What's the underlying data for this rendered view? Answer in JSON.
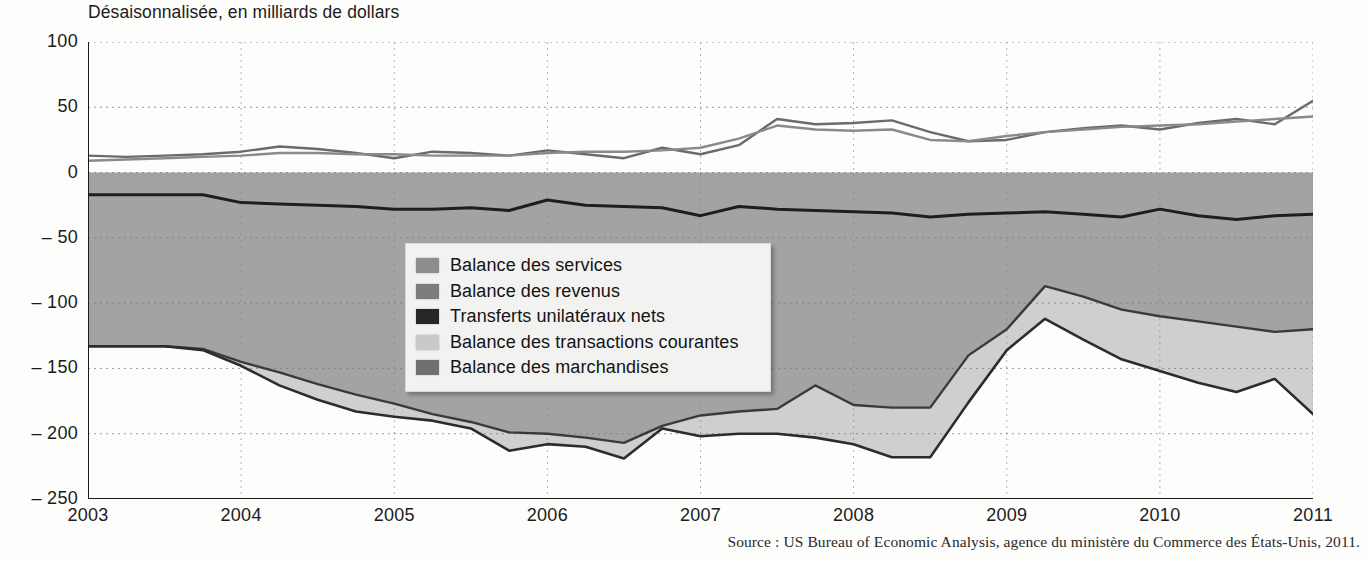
{
  "figure": {
    "subtitle": "Désaisonnalisée, en milliards de dollars",
    "source": "Source : US Bureau of Economic Analysis, agence du ministère du Commerce des États-Unis, 2011."
  },
  "legend": {
    "items": [
      {
        "label": "Balance des services",
        "color": "#8d8d8d",
        "key": "services"
      },
      {
        "label": "Balance des revenus",
        "color": "#7c7c7c",
        "key": "revenus"
      },
      {
        "label": "Transferts unilatéraux nets",
        "color": "#262626",
        "key": "transferts"
      },
      {
        "label": "Balance des transactions courantes",
        "color": "#c9c9c9",
        "key": "courantes"
      },
      {
        "label": "Balance des marchandises",
        "color": "#6f6f6f",
        "key": "marchandises"
      }
    ]
  },
  "chart_data": {
    "type": "area",
    "title": "",
    "subtitle": "Désaisonnalisée, en milliards de dollars",
    "xlabel": "",
    "ylabel": "milliards de dollars",
    "xlim": [
      2003,
      2011
    ],
    "ylim": [
      -250,
      100
    ],
    "yticks": [
      100,
      50,
      0,
      -50,
      -100,
      -150,
      -200,
      -250
    ],
    "ytick_labels": [
      "100",
      "50",
      "0",
      "– 50",
      "– 100",
      "– 150",
      "– 200",
      "– 250"
    ],
    "xticks": [
      2003,
      2004,
      2005,
      2006,
      2007,
      2008,
      2009,
      2010,
      2011
    ],
    "xtick_labels": [
      "2003",
      "2004",
      "2005",
      "2006",
      "2007",
      "2008",
      "2009",
      "2010",
      "2011"
    ],
    "grid": "dotted-both",
    "legend_position": "center",
    "x": [
      2003.0,
      2003.25,
      2003.5,
      2003.75,
      2004.0,
      2004.25,
      2004.5,
      2004.75,
      2005.0,
      2005.25,
      2005.5,
      2005.75,
      2006.0,
      2006.25,
      2006.5,
      2006.75,
      2007.0,
      2007.25,
      2007.5,
      2007.75,
      2008.0,
      2008.25,
      2008.5,
      2008.75,
      2009.0,
      2009.25,
      2009.5,
      2009.75,
      2010.0,
      2010.25,
      2010.5,
      2010.75,
      2011.0
    ],
    "series": [
      {
        "name": "Balance des services",
        "color": "#8d8d8d",
        "values": [
          13,
          12,
          13,
          14,
          16,
          20,
          18,
          15,
          11,
          16,
          15,
          13,
          17,
          14,
          11,
          19,
          14,
          21,
          41,
          37,
          38,
          40,
          31,
          24,
          25,
          31,
          34,
          36,
          33,
          38,
          41,
          37,
          55
        ]
      },
      {
        "name": "Balance des revenus",
        "color": "#7c7c7c",
        "values": [
          9,
          10,
          11,
          12,
          13,
          15,
          15,
          14,
          14,
          13,
          13,
          13,
          15,
          16,
          16,
          17,
          19,
          26,
          36,
          33,
          32,
          33,
          25,
          24,
          28,
          31,
          33,
          35,
          36,
          37,
          39,
          41,
          43
        ]
      },
      {
        "name": "Transferts unilatéraux nets",
        "color": "#262626",
        "values": [
          -17,
          -17,
          -17,
          -17,
          -23,
          -24,
          -25,
          -26,
          -28,
          -28,
          -27,
          -29,
          -21,
          -25,
          -26,
          -27,
          -33,
          -26,
          -28,
          -29,
          -30,
          -31,
          -34,
          -32,
          -31,
          -30,
          -32,
          -34,
          -28,
          -33,
          -36,
          -33,
          -32
        ]
      },
      {
        "name": "Balance des transactions courantes",
        "color": "#c9c9c9",
        "values": [
          -133,
          -133,
          -133,
          -135,
          -145,
          -153,
          -162,
          -170,
          -177,
          -185,
          -191,
          -199,
          -200,
          -203,
          -207,
          -194,
          -186,
          -183,
          -181,
          -163,
          -178,
          -180,
          -180,
          -140,
          -120,
          -87,
          -95,
          -105,
          -110,
          -114,
          -118,
          -122,
          -120
        ]
      },
      {
        "name": "Balance des marchandises",
        "color": "#6f6f6f",
        "values": [
          -133,
          -133,
          -133,
          -136,
          -148,
          -163,
          -174,
          -183,
          -187,
          -190,
          -196,
          -213,
          -208,
          -210,
          -219,
          -196,
          -202,
          -200,
          -200,
          -203,
          -208,
          -218,
          -218,
          -176,
          -136,
          -112,
          -128,
          -143,
          -152,
          -161,
          -168,
          -158,
          -185
        ]
      }
    ],
    "notes": [
      "Les deux courbes positives (services et revenus) se croisent près de 2011.",
      "La balance des marchandises atteint son creux à environ -218 en 2008."
    ]
  }
}
